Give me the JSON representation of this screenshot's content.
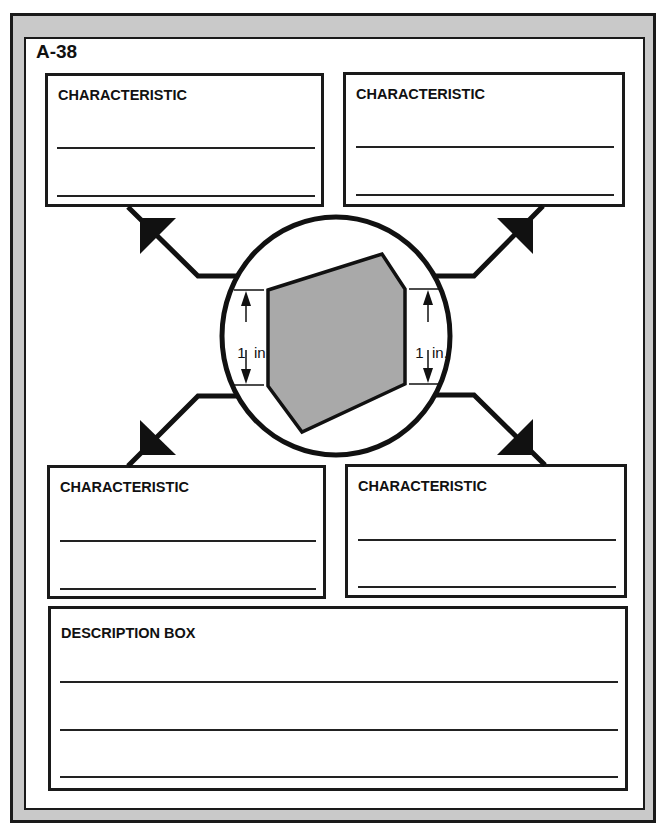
{
  "page": {
    "id_label": "A-38"
  },
  "characteristic_boxes": [
    {
      "position": "top-left",
      "title": "CHARACTERISTIC",
      "lines": 2
    },
    {
      "position": "top-right",
      "title": "CHARACTERISTIC",
      "lines": 2
    },
    {
      "position": "bottom-left",
      "title": "CHARACTERISTIC",
      "lines": 2
    },
    {
      "position": "bottom-right",
      "title": "CHARACTERISTIC",
      "lines": 2
    }
  ],
  "description_box": {
    "title": "DESCRIPTION BOX",
    "lines": 3
  },
  "center_figure": {
    "shape": "irregular hexagon (gray fill) inside circle",
    "fill_color": "#a9a9a9",
    "left_dimension": {
      "value": "1",
      "unit": "in."
    },
    "right_dimension": {
      "value": "1",
      "unit": "in."
    }
  },
  "colors": {
    "frame_gray": "#c9c9c9",
    "ink": "#1a1a1a",
    "paper": "#ffffff",
    "shape_gray": "#a9a9a9"
  }
}
